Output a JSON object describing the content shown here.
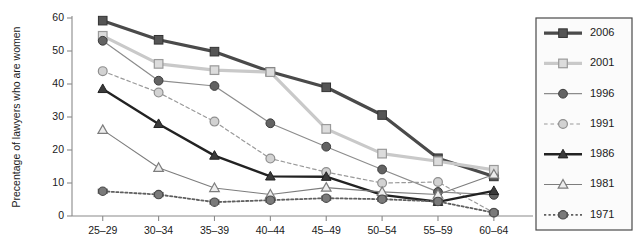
{
  "chart_data": {
    "type": "line",
    "title": "",
    "xlabel": "",
    "ylabel": "Precentage of lawyers who are women",
    "categories": [
      "25–29",
      "30–34",
      "35–39",
      "40–44",
      "45–49",
      "50–54",
      "55–59",
      "60–64"
    ],
    "ylim": [
      0,
      60
    ],
    "yticks": [
      0,
      10,
      20,
      30,
      40,
      50,
      60
    ],
    "ytick_labels": [
      "0",
      "10",
      "20",
      "30",
      "40",
      "50",
      "60"
    ],
    "grid": false,
    "legend_position": "right",
    "series": [
      {
        "name": "2006",
        "values": [
          59.2,
          53.4,
          49.8,
          43.7,
          39.0,
          30.6,
          17.5,
          12.0
        ],
        "color": "#4a4a4a",
        "marker": "square-filled",
        "dash": "solid",
        "width": 3.2
      },
      {
        "name": "2001",
        "values": [
          54.6,
          46.1,
          44.2,
          43.6,
          26.4,
          18.9,
          16.6,
          14.0
        ],
        "color": "#c9c9c9",
        "marker": "square-open",
        "dash": "solid",
        "width": 3.2
      },
      {
        "name": "1996",
        "values": [
          53.1,
          41.0,
          39.4,
          28.1,
          21.0,
          14.1,
          7.3,
          6.4
        ],
        "color": "#8c8c8c",
        "marker": "circle-filled",
        "dash": "solid",
        "width": 1.2
      },
      {
        "name": "1991",
        "values": [
          43.9,
          37.4,
          28.6,
          17.4,
          13.3,
          10.0,
          10.3,
          1.0
        ],
        "color": "#9a9a9a",
        "marker": "circle-open",
        "dash": "dashed",
        "width": 1.2
      },
      {
        "name": "1986",
        "values": [
          38.5,
          27.9,
          18.3,
          12.0,
          11.9,
          6.4,
          4.3,
          7.6
        ],
        "color": "#222222",
        "marker": "triangle-filled",
        "dash": "solid",
        "width": 2.4
      },
      {
        "name": "1981",
        "values": [
          26.1,
          14.6,
          8.5,
          6.5,
          8.6,
          7.3,
          6.5,
          12.6
        ],
        "color": "#7d7d7d",
        "marker": "triangle-open",
        "dash": "solid",
        "width": 1.1
      },
      {
        "name": "1971",
        "values": [
          7.5,
          6.5,
          4.2,
          4.8,
          5.4,
          5.1,
          4.4,
          1.0
        ],
        "color": "#5f5f5f",
        "marker": "circle-dot",
        "dash": "dotted",
        "width": 1.8
      }
    ]
  },
  "legend": {
    "items": [
      {
        "label": "2006"
      },
      {
        "label": "2001"
      },
      {
        "label": "1996"
      },
      {
        "label": "1991"
      },
      {
        "label": "1986"
      },
      {
        "label": "1981"
      },
      {
        "label": "1971"
      }
    ]
  }
}
